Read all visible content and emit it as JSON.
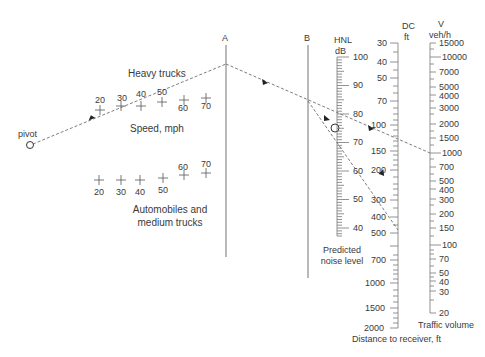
{
  "nomograph": {
    "pivot_label": "pivot",
    "line_a_label": "A",
    "line_b_label": "B",
    "heavy_trucks_label": "Heavy trucks",
    "speed_label": "Speed, mph",
    "autos_label_line1": "Automobiles and",
    "autos_label_line2": "medium trucks",
    "heavy_truck_speeds": [
      {
        "label": "20",
        "x": 100,
        "y": 110
      },
      {
        "label": "30",
        "x": 121,
        "y": 106
      },
      {
        "label": "40",
        "x": 141,
        "y": 106
      },
      {
        "label": "50",
        "x": 162,
        "y": 102
      },
      {
        "label": "60",
        "x": 184,
        "y": 100
      },
      {
        "label": "70",
        "x": 206,
        "y": 98
      }
    ],
    "auto_speeds": [
      {
        "label": "20",
        "x": 99,
        "y": 180
      },
      {
        "label": "30",
        "x": 121,
        "y": 180
      },
      {
        "label": "40",
        "x": 140,
        "y": 180
      },
      {
        "label": "50",
        "x": 163,
        "y": 178
      },
      {
        "label": "60",
        "x": 184,
        "y": 175
      },
      {
        "label": "70",
        "x": 206,
        "y": 173
      }
    ],
    "hnl_scale": {
      "title": "HNL",
      "unit": "dB",
      "ticks": [
        "100",
        "90",
        "80",
        "70",
        "60",
        "50",
        "40"
      ],
      "caption_line1": "Predicted",
      "caption_line2": "noise level"
    },
    "dc_scale": {
      "title": "DC",
      "unit": "ft",
      "ticks": [
        "30",
        "40",
        "50",
        "70",
        "100",
        "150",
        "200",
        "300",
        "400",
        "500",
        "700",
        "1000",
        "1500",
        "2000"
      ],
      "caption": "Distance to receiver, ft"
    },
    "v_scale": {
      "title": "V",
      "unit": "veh/h",
      "ticks": [
        "15000",
        "10000",
        "7000",
        "5000",
        "4000",
        "3000",
        "2000",
        "1500",
        "1000",
        "700",
        "500",
        "400",
        "300",
        "200",
        "150",
        "100",
        "70",
        "50",
        "40",
        "30",
        "20"
      ],
      "caption": "Traffic volume"
    },
    "colors": {
      "line": "#8a8a8a",
      "text": "#3a3a3a",
      "dash": "#6e6e6e"
    }
  }
}
